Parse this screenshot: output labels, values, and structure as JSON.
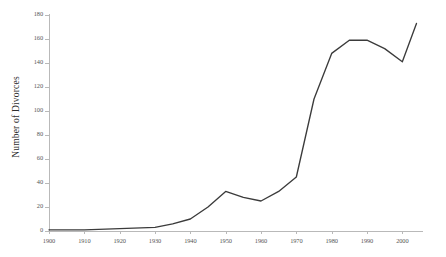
{
  "chart_data": {
    "type": "line",
    "title": "",
    "xlabel": "",
    "ylabel": "Number of Divorces",
    "xlim": [
      1900,
      2005
    ],
    "ylim": [
      0,
      180
    ],
    "grid": false,
    "legend": false,
    "legend_position": "none",
    "line_color": "#3b3b3b",
    "axis_color": "#b9b9b9",
    "x_ticks": [
      1900,
      1910,
      1920,
      1930,
      1940,
      1950,
      1960,
      1970,
      1980,
      1990,
      2000
    ],
    "x_tick_labels": [
      "1900",
      "1910",
      "1920",
      "1930",
      "1940",
      "1950",
      "1960",
      "1970",
      "1980",
      "1990",
      "2000"
    ],
    "y_ticks": [
      0,
      20,
      40,
      60,
      80,
      100,
      120,
      140,
      160,
      180
    ],
    "y_tick_labels": [
      "0",
      "20",
      "40",
      "60",
      "80",
      "100",
      "120",
      "140",
      "160",
      "180"
    ],
    "series": [
      {
        "name": "Number of Divorces",
        "x": [
          1900,
          1910,
          1920,
          1930,
          1935,
          1940,
          1945,
          1950,
          1955,
          1960,
          1965,
          1970,
          1975,
          1980,
          1985,
          1990,
          1995,
          2000,
          2004
        ],
        "values": [
          1,
          1,
          2,
          3,
          6,
          10,
          20,
          33,
          28,
          25,
          33,
          45,
          110,
          148,
          159,
          159,
          152,
          141,
          173
        ]
      }
    ]
  },
  "axis": {
    "y_title": "Number of Divorces"
  }
}
